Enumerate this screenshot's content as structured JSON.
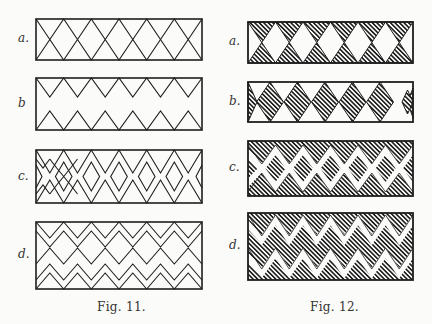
{
  "figures": [
    {
      "caption": "Fig. 11.",
      "style": "outline",
      "panels": [
        {
          "label": "a.",
          "pattern": "diamond-lattice"
        },
        {
          "label": "b",
          "pattern": "opposed-zigzag-triangles"
        },
        {
          "label": "c.",
          "pattern": "double-zigzag-chain-of-diamonds"
        },
        {
          "label": "d.",
          "pattern": "triple-zigzag-bands"
        }
      ]
    },
    {
      "caption": "Fig. 12.",
      "style": "hatched",
      "panels": [
        {
          "label": "a.",
          "pattern": "hatched-triangles-top-bottom"
        },
        {
          "label": "b.",
          "pattern": "hatched-diamond-row"
        },
        {
          "label": "c.",
          "pattern": "hatched-double-zigzag"
        },
        {
          "label": "d.",
          "pattern": "hatched-triple-zigzag"
        }
      ]
    }
  ],
  "colors": {
    "ink": "#1e1e1e",
    "paper": "#fbfbf9"
  }
}
